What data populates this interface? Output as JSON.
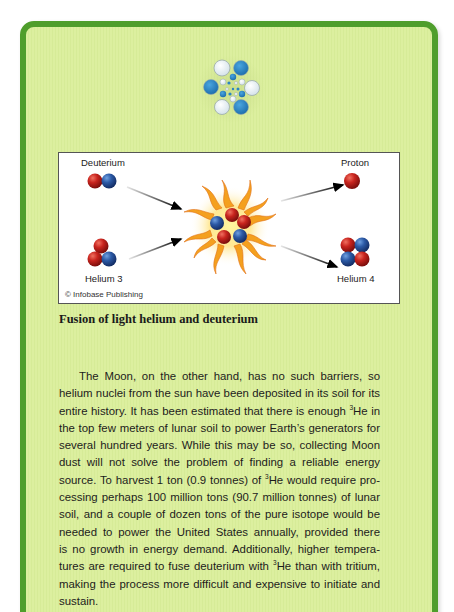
{
  "logo": {
    "icon": "atom-cluster-icon",
    "colors": {
      "blue": "#2a84c4",
      "white": "#e6eef3"
    }
  },
  "figure": {
    "labels": {
      "deuterium": "Deuterium",
      "helium3": "Helium 3",
      "proton": "Proton",
      "helium4": "Helium 4"
    },
    "credit": "© Infobase Publishing",
    "colors": {
      "proton": "#c0201c",
      "neutron": "#2c5aa6",
      "flame": "#f0a020"
    }
  },
  "caption": "Fusion of light helium and deuterium",
  "body": {
    "lines": [
      [
        "The Moon, on the other hand, has no such barriers, so"
      ],
      [
        "helium nuclei from the sun have been deposited in its soil for its"
      ],
      [
        "entire history. It has been estimated that there is enough ",
        "3",
        "He in"
      ],
      [
        "the top few meters of lunar soil to power Earth’s generators for"
      ],
      [
        "several hundred years. While this may be so, collecting Moon"
      ],
      [
        "dust will not solve the problem of finding a reliable energy"
      ],
      [
        "source. To harvest 1 ton (0.9 tonnes) of ",
        "3",
        "He would require pro-"
      ],
      [
        "cessing perhaps 100 million tons (90.7 million tonnes) of lunar"
      ],
      [
        "soil, and a couple of dozen tons of the pure isotope would be"
      ],
      [
        "needed to power the United States annually, provided there"
      ],
      [
        "is no growth in energy demand. Additionally, higher tempera-"
      ],
      [
        "tures are required to fuse deuterium with ",
        "3",
        "He than with tritium,"
      ],
      [
        "making the process more difficult and expensive to initiate and"
      ],
      [
        "sustain."
      ]
    ]
  },
  "frame": {
    "border_color": "#4f9e2c",
    "fill_color": "#dcef9f"
  }
}
